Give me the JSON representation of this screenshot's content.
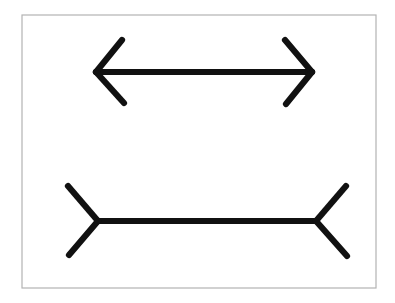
{
  "image": {
    "title": "Müller-Lyer illusion figure",
    "description": "Two horizontal line segments of equal length; the upper one terminates in outward-pointing arrowheads and the lower one terminates in inward-pointing fins.",
    "width": 395,
    "height": 303,
    "background_color": "#ffffff"
  },
  "frame": {
    "name": "plate-border",
    "x": 22,
    "y": 15,
    "width": 354,
    "height": 273,
    "stroke_color": "#b3b3b3",
    "stroke_width": 1.2,
    "fill_color": "#ffffff"
  },
  "ink": {
    "stroke_color": "#111111",
    "stroke_width": 6.2,
    "linecap": "round"
  },
  "figures": [
    {
      "id": "top-figure",
      "name": "double-headed-arrow-outward",
      "arrowhead_direction": "outward",
      "shaft": {
        "x1": 96,
        "y1": 72,
        "x2": 312,
        "y2": 72,
        "length": 216
      },
      "fins": [
        {
          "name": "left-upper-fin",
          "x1": 96,
          "y1": 72,
          "x2": 122,
          "y2": 40
        },
        {
          "name": "left-lower-fin",
          "x1": 96,
          "y1": 72,
          "x2": 124,
          "y2": 103
        },
        {
          "name": "right-upper-fin",
          "x1": 312,
          "y1": 72,
          "x2": 285,
          "y2": 40
        },
        {
          "name": "right-lower-fin",
          "x1": 312,
          "y1": 72,
          "x2": 286,
          "y2": 104
        }
      ]
    },
    {
      "id": "bottom-figure",
      "name": "double-headed-arrow-inward",
      "arrowhead_direction": "inward",
      "shaft": {
        "x1": 98,
        "y1": 221,
        "x2": 316,
        "y2": 221,
        "length": 218
      },
      "fins": [
        {
          "name": "left-upper-fin",
          "x1": 98,
          "y1": 221,
          "x2": 68,
          "y2": 186
        },
        {
          "name": "left-lower-fin",
          "x1": 98,
          "y1": 221,
          "x2": 69,
          "y2": 255
        },
        {
          "name": "right-upper-fin",
          "x1": 316,
          "y1": 221,
          "x2": 346,
          "y2": 186
        },
        {
          "name": "right-lower-fin",
          "x1": 316,
          "y1": 221,
          "x2": 347,
          "y2": 256
        }
      ]
    }
  ]
}
